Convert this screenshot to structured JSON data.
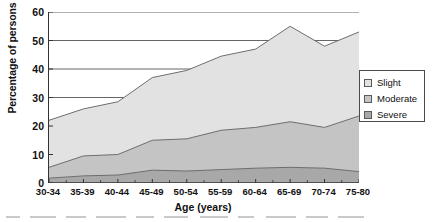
{
  "chart_data": {
    "type": "area",
    "stacked": true,
    "title": "",
    "xlabel": "Age (years)",
    "ylabel": "Percentage of persons",
    "categories": [
      "30-34",
      "35-39",
      "40-44",
      "45-49",
      "50-54",
      "55-59",
      "60-64",
      "65-69",
      "70-74",
      "75-80"
    ],
    "ylim": [
      0,
      60
    ],
    "yticks": [
      0,
      10,
      20,
      30,
      40,
      50,
      60
    ],
    "grid": true,
    "grid_axis": "y",
    "legend_position": "right",
    "series": [
      {
        "name": "Severe",
        "color": "#a8a8a8",
        "values": [
          1.7,
          2.5,
          2.8,
          4.5,
          4.2,
          4.7,
          5.2,
          5.5,
          5.2,
          4.0
        ]
      },
      {
        "name": "Moderate",
        "color": "#c4c4c4",
        "values": [
          3.8,
          7.0,
          7.2,
          10.5,
          11.3,
          13.8,
          14.3,
          16.0,
          14.3,
          19.5
        ]
      },
      {
        "name": "Slight",
        "color": "#e2e2e2",
        "values": [
          16.5,
          16.5,
          18.5,
          22.0,
          24.0,
          26.0,
          27.5,
          33.5,
          28.5,
          29.5
        ]
      }
    ],
    "cumulative_totals": [
      22.0,
      26.0,
      28.5,
      37.0,
      39.5,
      44.5,
      47.0,
      55.0,
      48.0,
      53.0
    ],
    "cumulative_moderate_plus_severe": [
      5.5,
      9.5,
      10.0,
      15.0,
      15.5,
      18.5,
      19.5,
      21.5,
      19.5,
      23.5
    ]
  },
  "legend": {
    "items": [
      {
        "label": "Slight",
        "color": "#e2e2e2"
      },
      {
        "label": "Moderate",
        "color": "#c4c4c4"
      },
      {
        "label": "Severe",
        "color": "#a8a8a8"
      }
    ]
  },
  "axes": {
    "y_title": "Percentage of persons",
    "x_title": "Age (years)",
    "y_ticks": [
      "0",
      "10",
      "20",
      "30",
      "40",
      "50",
      "60"
    ],
    "x_ticks": [
      "30-34",
      "35-39",
      "40-44",
      "45-49",
      "50-54",
      "55-59",
      "60-64",
      "65-69",
      "70-74",
      "75-80"
    ]
  },
  "colors": {
    "axis": "#333333",
    "grid": "#555555",
    "plot_background": "#ffffff"
  }
}
